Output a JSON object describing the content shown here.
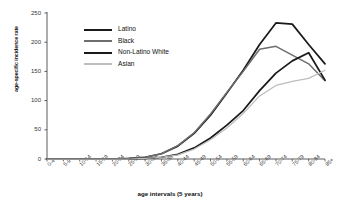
{
  "chart_data": {
    "type": "line",
    "title": "",
    "xlabel": "age intervals (5 years)",
    "ylabel": "age-specific incidence rate",
    "ylim": [
      0,
      250
    ],
    "yticks": [
      0,
      50,
      100,
      150,
      200,
      250
    ],
    "grid": false,
    "legend_position": "upper-left-inside",
    "categories": [
      "0-4",
      "5-9",
      "10-14",
      "15-19",
      "20-24",
      "25-29",
      "30-34",
      "35-39",
      "40-44",
      "45-49",
      "50-54",
      "55-59",
      "60-64",
      "65-69",
      "70-74",
      "75-79",
      "80-84",
      "85+"
    ],
    "series": [
      {
        "name": "Latino",
        "color": "#1a1a1a",
        "values": [
          0,
          0,
          0,
          0,
          0,
          1,
          3,
          9,
          22,
          44,
          75,
          113,
          152,
          196,
          233,
          231,
          196,
          163
        ]
      },
      {
        "name": "Black",
        "color": "#6e6e6e",
        "values": [
          0,
          0,
          0,
          0,
          0,
          1,
          3,
          9,
          23,
          45,
          77,
          114,
          150,
          188,
          193,
          178,
          163,
          134
        ]
      },
      {
        "name": "Non-Latino White",
        "color": "#1a1a1a",
        "values": [
          0,
          0,
          0,
          0,
          0,
          0,
          1,
          3,
          8,
          19,
          36,
          58,
          83,
          117,
          147,
          168,
          182,
          135
        ]
      },
      {
        "name": "Asian",
        "color": "#bdbdbd",
        "values": [
          0,
          0,
          0,
          0,
          0,
          0,
          1,
          3,
          7,
          17,
          33,
          53,
          78,
          108,
          126,
          133,
          138,
          152
        ]
      }
    ]
  },
  "axes": {
    "y_ticks": [
      "250",
      "200",
      "150",
      "100",
      "50",
      "0"
    ],
    "x_ticks": [
      "0-4",
      "5-9",
      "10-14",
      "15-19",
      "20-24",
      "25-29",
      "30-34",
      "35-39",
      "40-44",
      "45-49",
      "50-54",
      "55-59",
      "60-64",
      "65-69",
      "70-74",
      "75-79",
      "80-84",
      "85+"
    ]
  },
  "legend": {
    "items": [
      {
        "label": "Latino"
      },
      {
        "label": "Black"
      },
      {
        "label": "Non-Latino White"
      },
      {
        "label": "Asian"
      }
    ]
  }
}
